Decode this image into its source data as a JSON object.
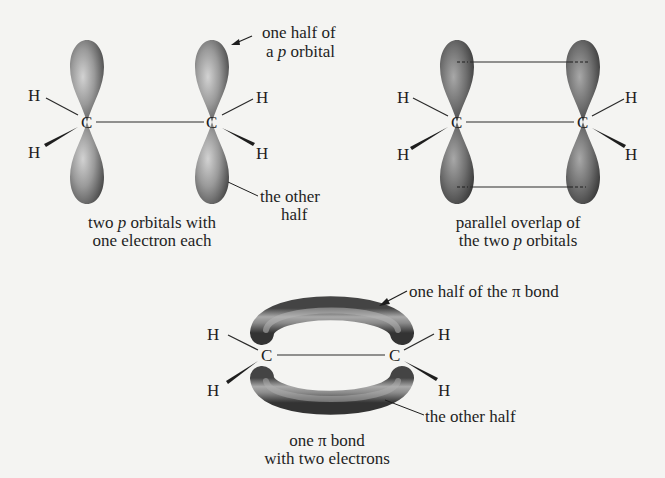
{
  "colors": {
    "background": "#f4f4f2",
    "ink": "#1e1e1e",
    "lobe_light": "#b8b8b8",
    "lobe_dark": "#3c3c3c"
  },
  "atoms": {
    "carbon": "C",
    "hydrogen": "H"
  },
  "panel1": {
    "callout_top": {
      "line1": "one half of",
      "line2_prefix": "a ",
      "line2_italic": "p",
      "line2_suffix": " orbital"
    },
    "callout_bottom": {
      "line1": "the other",
      "line2": "half"
    },
    "caption": {
      "line1_prefix": "two ",
      "line1_italic": "p",
      "line1_suffix": " orbitals with",
      "line2": "one electron each"
    }
  },
  "panel2": {
    "caption": {
      "line1": "parallel overlap of",
      "line2_prefix": "the two ",
      "line2_italic": "p",
      "line2_suffix": " orbitals"
    }
  },
  "panel3": {
    "callout_top": "one half of the π bond",
    "callout_bottom": "the other half",
    "caption": {
      "line1": "one π bond",
      "line2": "with two electrons"
    }
  }
}
